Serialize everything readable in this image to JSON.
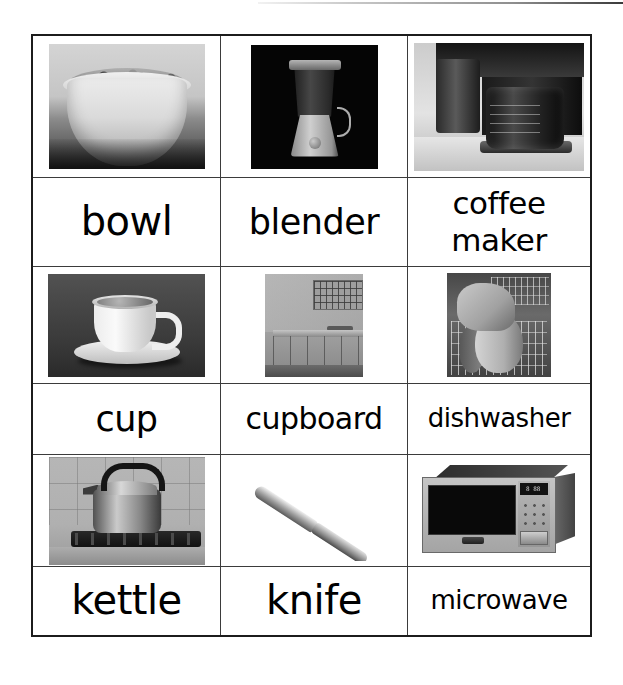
{
  "page": {
    "type": "vocabulary-flash-card-sheet",
    "topic": "kitchen",
    "top_rule_visible": true
  },
  "grid": {
    "columns": 3,
    "rows": 3,
    "border_color": "#1c1c1c",
    "cell_border_color": "#3b3b3b",
    "background": "#ffffff"
  },
  "cards": [
    {
      "label": "bowl",
      "label_lines": [
        "bowl"
      ],
      "image_name": "bowl-photo",
      "image_alt": "black and white photo of a bowl of cereal with nuts",
      "size_class": "lb-xl"
    },
    {
      "label": "blender",
      "label_lines": [
        "blender"
      ],
      "image_name": "blender-photo",
      "image_alt": "black and white photo of a blender on a black background",
      "size_class": "lb-lg"
    },
    {
      "label": "coffee maker",
      "label_lines": [
        "coffee",
        "maker"
      ],
      "image_name": "coffee-maker-photo",
      "image_alt": "black and white photo of a coffee maker with glass carafe on a counter",
      "size_class": "lb-two"
    },
    {
      "label": "cup",
      "label_lines": [
        "cup"
      ],
      "image_name": "cup-photo",
      "image_alt": "black and white photo of a white cup and saucer on a dark background",
      "size_class": "lb-lg"
    },
    {
      "label": "cupboard",
      "label_lines": [
        "cupboard"
      ],
      "image_name": "cupboard-photo",
      "image_alt": "black and white photo of a kitchen with glass front wall cupboards and base units",
      "size_class": "lb-md"
    },
    {
      "label": "dishwasher",
      "label_lines": [
        "dishwasher"
      ],
      "image_name": "dishwasher-photo",
      "image_alt": "black and white photo of a hand loading plates into a dishwasher rack",
      "size_class": "lb-sm"
    },
    {
      "label": "kettle",
      "label_lines": [
        "kettle"
      ],
      "image_name": "kettle-photo",
      "image_alt": "black and white photo of a stovetop kettle with black handle on a gas hob",
      "size_class": "lb-xl"
    },
    {
      "label": "knife",
      "label_lines": [
        "knife"
      ],
      "image_name": "knife-photo",
      "image_alt": "black and white photo of a table knife lying diagonally",
      "size_class": "lb-xl"
    },
    {
      "label": "microwave",
      "label_lines": [
        "microwave"
      ],
      "image_name": "microwave-photo",
      "image_alt": "black and white photo of a microwave oven with keypad and display",
      "size_class": "lb-sm"
    }
  ],
  "microwave_display": "8 88"
}
